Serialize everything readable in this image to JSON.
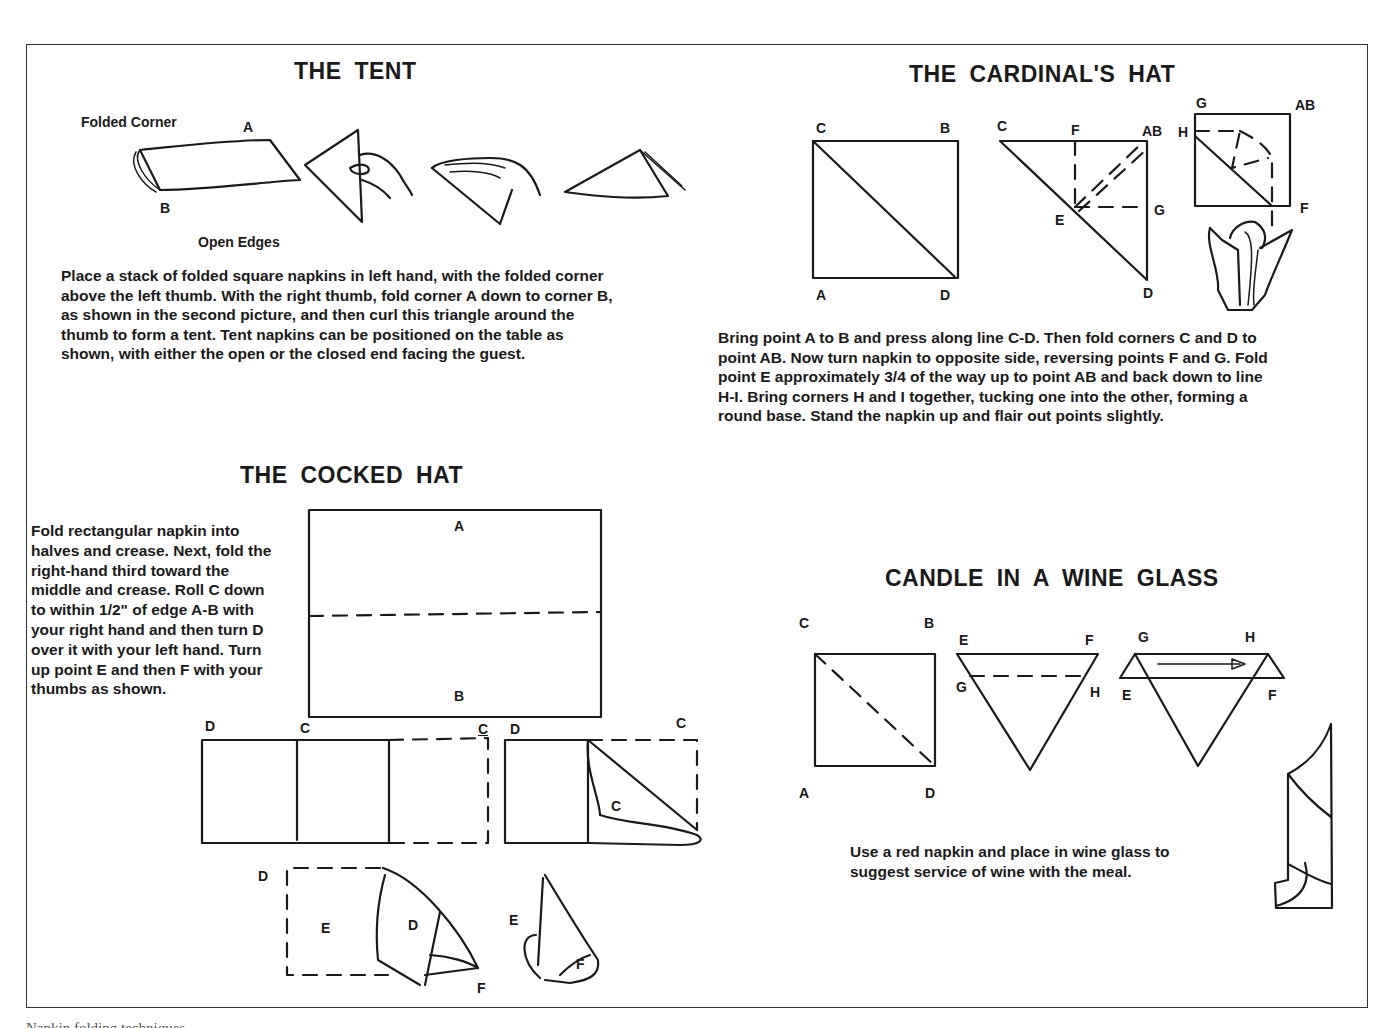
{
  "sections": {
    "tent": {
      "title": "THE TENT",
      "labels": {
        "folded_corner": "Folded Corner",
        "a": "A",
        "b": "B",
        "open_edges": "Open Edges"
      },
      "instructions": [
        "Place a stack of folded square napkins in left hand, with the folded corner",
        "above the left thumb. With the right thumb, fold corner A down to corner B,",
        "as shown in the second picture, and then curl this triangle around the",
        "thumb to form a tent. Tent napkins can be positioned on the table as",
        "shown, with either the open or the closed end facing the guest."
      ]
    },
    "cardinals_hat": {
      "title": "THE  CARDINAL'S  HAT",
      "labels": {
        "fig1": {
          "c": "C",
          "b": "B",
          "a": "A",
          "d": "D"
        },
        "fig2": {
          "c": "C",
          "f": "F",
          "ab": "AB",
          "e": "E",
          "g": "G",
          "d": "D"
        },
        "fig3": {
          "g": "G",
          "ab": "AB",
          "h": "H",
          "f": "F"
        }
      },
      "instructions": [
        "Bring point A to B and press along line C-D. Then fold corners C and D to",
        "point AB. Now turn napkin to opposite side, reversing points F and G. Fold",
        "point E approximately 3/4 of the way up to point AB and back down to line",
        "H-I. Bring corners H and I together, tucking one into the other, forming a",
        "round base. Stand the napkin up and flair out points slightly."
      ]
    },
    "cocked_hat": {
      "title": "THE  COCKED  HAT",
      "labels": {
        "fig1": {
          "a": "A",
          "b": "B"
        },
        "fig2": {
          "d": "D",
          "c": "C",
          "c2": "C"
        },
        "fig3": {
          "d": "D",
          "c": "C",
          "c_inner": "C"
        },
        "fig4": {
          "d": "D",
          "e": "E",
          "d_inner": "D",
          "f": "F"
        },
        "fig5": {
          "e": "E",
          "f": "F"
        }
      },
      "instructions": [
        "Fold rectangular napkin into",
        "halves and crease. Next, fold the",
        "right-hand third toward the",
        "middle and crease. Roll C down",
        "to within 1/2\" of edge A-B with",
        "your right hand and then turn D",
        "over it with your left hand. Turn",
        "up point E and then F with your",
        "thumbs as shown."
      ]
    },
    "candle": {
      "title": "CANDLE  IN  A  WINE  GLASS",
      "labels": {
        "fig1": {
          "c": "C",
          "b": "B",
          "a": "A",
          "d": "D"
        },
        "fig2": {
          "e": "E",
          "f": "F",
          "g": "G",
          "h": "H"
        },
        "fig3": {
          "g": "G",
          "h": "H",
          "e": "E",
          "f": "F"
        }
      },
      "instructions": [
        "Use a red napkin and place in wine glass to",
        "suggest service of wine with the meal."
      ]
    }
  },
  "caption": "Napkin folding techniques"
}
